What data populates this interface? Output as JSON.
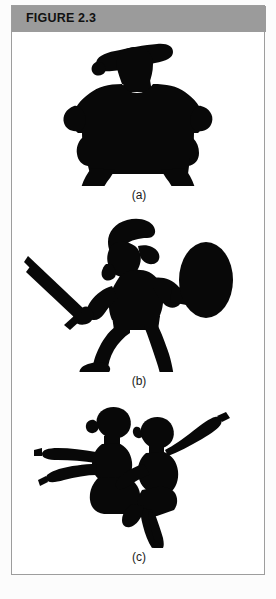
{
  "page": {
    "background_color": "#fcfcfc"
  },
  "figure": {
    "header": {
      "label": "FIGURE 2.3",
      "band_color": "#9b9b9b",
      "text_color": "#111111"
    },
    "border_color": "#9d9d9d",
    "background_color": "#ffffff",
    "silhouette_color": "#080808",
    "panels": [
      {
        "key": "a",
        "label": "(a)",
        "subject": "standing-armored-warrior-silhouette",
        "description": "Bulky standing figure in armor with wide brimmed helmet, arms at sides, legs apart"
      },
      {
        "key": "b",
        "label": "(b)",
        "subject": "warrior-with-sword-and-shield-silhouette",
        "description": "Crested-helmet warrior lunging, sword raised in one hand, round shield in the other"
      },
      {
        "key": "c",
        "label": "(c)",
        "subject": "two-dancers-silhouette",
        "description": "Two overlapping ballet dancers with arms outstretched, one leg pointed"
      }
    ]
  }
}
